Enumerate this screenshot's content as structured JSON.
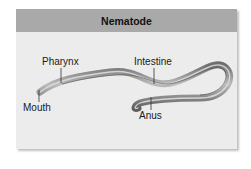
{
  "title": "Nematode",
  "labels": {
    "pharynx": "Pharynx",
    "intestine": "Intestine",
    "mouth": "Mouth",
    "anus": "Anus"
  },
  "colors": {
    "header_bg": "#a9a9a9",
    "panel_bg": "#ececec",
    "worm_body": "#8a8a8a",
    "worm_highlight": "#d0d0d0",
    "leader_line": "#333333"
  }
}
